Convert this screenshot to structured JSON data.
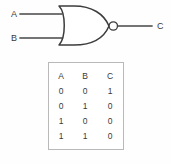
{
  "diagram": {
    "type": "logic-gate-nor",
    "gate_name": "NOR",
    "inputs": [
      {
        "id": "a",
        "label": "A"
      },
      {
        "id": "b",
        "label": "B"
      }
    ],
    "output": {
      "id": "c",
      "label": "C"
    },
    "line_color": "#464646",
    "gate_stroke": "#3c3c3c",
    "background": "#fefefe"
  },
  "truth_table": {
    "border_color": "#b9b9b9",
    "headers": [
      "A",
      "B",
      "C"
    ],
    "rows": [
      [
        "0",
        "0",
        "1"
      ],
      [
        "0",
        "1",
        "0"
      ],
      [
        "1",
        "0",
        "0"
      ],
      [
        "1",
        "1",
        "0"
      ]
    ]
  }
}
